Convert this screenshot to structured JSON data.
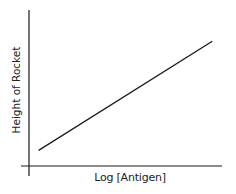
{
  "chart_data": {
    "type": "line",
    "title": "",
    "xlabel": "Log [Antigen]",
    "ylabel": "Height of Rocket",
    "x_ticks": [],
    "y_ticks": [],
    "grid": false,
    "legend": null,
    "series": [
      {
        "name": "standard curve",
        "x": [
          0.05,
          0.95
        ],
        "y": [
          0.1,
          0.8
        ],
        "color": "#1a1a1a"
      }
    ],
    "xlim": [
      0,
      1
    ],
    "ylim": [
      0,
      1
    ],
    "annotations": []
  },
  "colors": {
    "axis": "#1a1a1a",
    "line": "#1a1a1a",
    "background": "#ffffff"
  }
}
